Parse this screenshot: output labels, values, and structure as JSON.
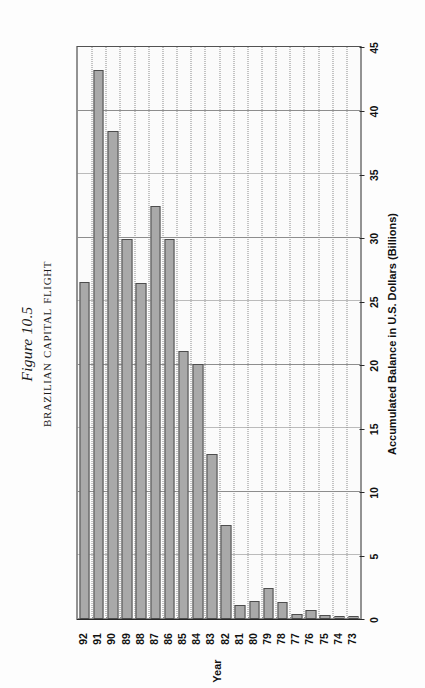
{
  "figure": {
    "number_label": "Figure 10.5",
    "title": "Brazilian Capital Flight"
  },
  "chart_data": {
    "type": "bar",
    "orientation": "horizontal",
    "title": "Brazilian Capital Flight",
    "subtitle": "Figure 10.5",
    "xlabel": "Accumulated Balance in U.S. Dollars (Billions)",
    "ylabel": "Year",
    "categories": [
      "73",
      "74",
      "75",
      "76",
      "77",
      "78",
      "79",
      "80",
      "81",
      "82",
      "83",
      "84",
      "85",
      "86",
      "87",
      "88",
      "89",
      "90",
      "91",
      "92"
    ],
    "values": [
      0.2,
      0.2,
      0.3,
      0.7,
      0.4,
      1.3,
      2.4,
      1.4,
      1.1,
      7.4,
      13.0,
      20.1,
      21.1,
      29.9,
      32.5,
      26.4,
      29.9,
      38.4,
      43.2,
      26.5
    ],
    "value_axis": {
      "min": 0,
      "max": 45,
      "tick_step": 5,
      "ticks": [
        "0",
        "5",
        "10",
        "15",
        "20",
        "25",
        "30",
        "35",
        "40",
        "45"
      ]
    },
    "category_axis": {
      "ticks": [
        "73",
        "74",
        "75",
        "76",
        "77",
        "78",
        "79",
        "80",
        "81",
        "82",
        "83",
        "84",
        "85",
        "86",
        "87",
        "88",
        "89",
        "90",
        "91",
        "92"
      ],
      "label": "Year"
    },
    "grid": true,
    "legend": "none",
    "bar_color": "#a9a9a9",
    "bar_border_color": "#4d4d4d",
    "plot_background": "#fbfbfb"
  }
}
